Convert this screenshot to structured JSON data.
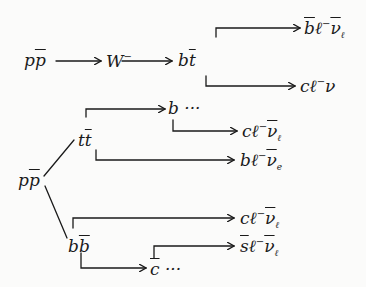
{
  "diagram": {
    "title": "",
    "ink_color": "#1a1a1a",
    "nodes": {
      "ppbar_top": {
        "base": "p",
        "bar": "p",
        "sup": "",
        "tail": ""
      },
      "w_minus": {
        "base": "W",
        "bar": "",
        "sup": "−",
        "tail": ""
      },
      "b_tbar": {
        "base": "b",
        "bar": "t",
        "sup": "",
        "tail": ""
      },
      "bbar_l_nubar": {
        "bar_lead": "b",
        "mid": "ℓ",
        "sup": "−",
        "nu": "ν",
        "sub": "ℓ"
      },
      "c_l_nu": {
        "lead": "c",
        "mid": "ℓ",
        "sup": "−",
        "nu": "ν",
        "sub": ""
      },
      "ppbar_bottom": {
        "base": "p",
        "bar": "p"
      },
      "t_tbar": {
        "base": "t",
        "bar": "t"
      },
      "b_dots": {
        "base": "b",
        "tail": " ···"
      },
      "c_l_nubar_1": {
        "lead": "c",
        "mid": "ℓ",
        "sup": "−",
        "nu": "ν",
        "sub": "ℓ"
      },
      "b_l_nubar": {
        "lead": "b",
        "mid": "ℓ",
        "sup": "−",
        "nu": "ν",
        "sub": "e"
      },
      "b_bbar": {
        "base": "b",
        "bar": "b"
      },
      "c_l_nubar_2": {
        "lead": "c",
        "mid": "ℓ",
        "sup": "−",
        "nu": "ν",
        "sub": "ℓ"
      },
      "sbar_l_nubar": {
        "bar_lead": "s",
        "mid": "ℓ",
        "sup": "−",
        "nu": "ν",
        "sub": "ℓ"
      },
      "cbar_dots": {
        "bar_lead": "c",
        "tail": " ···"
      }
    },
    "edges": [
      {
        "from": "ppbar_top",
        "to": "w_minus",
        "type": "arrow"
      },
      {
        "from": "w_minus",
        "to": "b_tbar",
        "type": "arrow"
      },
      {
        "from": "b_tbar",
        "to": "bbar_l_nubar",
        "type": "elbow-up-arrow"
      },
      {
        "from": "b_tbar",
        "to": "c_l_nu",
        "type": "elbow-down-arrow"
      },
      {
        "from": "ppbar_bottom",
        "to": "t_tbar",
        "type": "line"
      },
      {
        "from": "ppbar_bottom",
        "to": "b_bbar",
        "type": "line"
      },
      {
        "from": "t_tbar",
        "to": "b_dots",
        "type": "elbow-up-arrow"
      },
      {
        "from": "b_dots",
        "to": "c_l_nubar_1",
        "type": "elbow-down-arrow"
      },
      {
        "from": "t_tbar",
        "to": "b_l_nubar",
        "type": "elbow-down-arrow"
      },
      {
        "from": "b_bbar",
        "to": "c_l_nubar_2",
        "type": "elbow-up-arrow"
      },
      {
        "from": "b_bbar",
        "to": "cbar_dots",
        "type": "elbow-down-arrow"
      },
      {
        "from": "cbar_dots",
        "to": "sbar_l_nubar",
        "type": "elbow-up-arrow"
      }
    ]
  }
}
